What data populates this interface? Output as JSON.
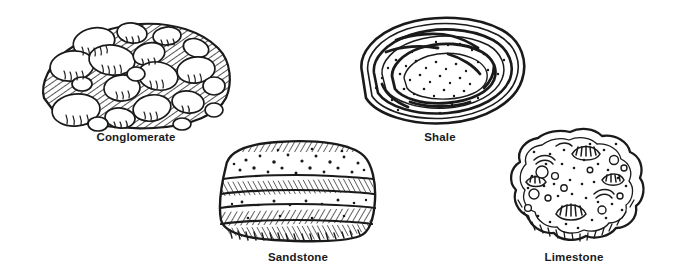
{
  "figure": {
    "background_color": "#ffffff",
    "ink_color": "#1a1a1a",
    "label_color": "#1a1a1a",
    "style": "pen-and-ink line drawing"
  },
  "specimens": [
    {
      "id": "conglomerate",
      "label": "Conglomerate",
      "texture": "rounded-pebbles-in-hatched-matrix",
      "icon": "conglomerate-rock-icon"
    },
    {
      "id": "shale",
      "label": "Shale",
      "texture": "concentric-wavy-laminations-with-stipple",
      "icon": "shale-rock-icon"
    },
    {
      "id": "sandstone",
      "label": "Sandstone",
      "texture": "horizontal-strata-bands-with-stipple-and-hatching",
      "icon": "sandstone-rock-icon"
    },
    {
      "id": "limestone",
      "label": "Limestone",
      "texture": "fossil-shells-and-vugs-with-stipple",
      "icon": "limestone-rock-icon"
    }
  ]
}
